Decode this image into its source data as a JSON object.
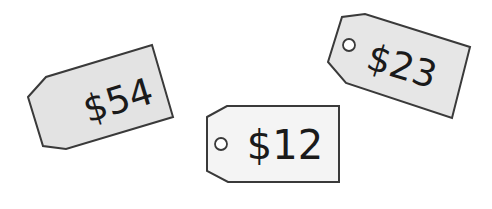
{
  "colors": {
    "background": "#ffffff",
    "outline": "#3a3a3a",
    "text": "#1a1a1a",
    "hole_fill": "#ffffff"
  },
  "tags": [
    {
      "id": "tag-54",
      "price": "$54",
      "has_hole": false,
      "fill": "#e3e3e3"
    },
    {
      "id": "tag-12",
      "price": "$12",
      "has_hole": true,
      "fill": "#f4f4f4"
    },
    {
      "id": "tag-23",
      "price": "$23",
      "has_hole": true,
      "fill": "#e6e6e6"
    }
  ]
}
